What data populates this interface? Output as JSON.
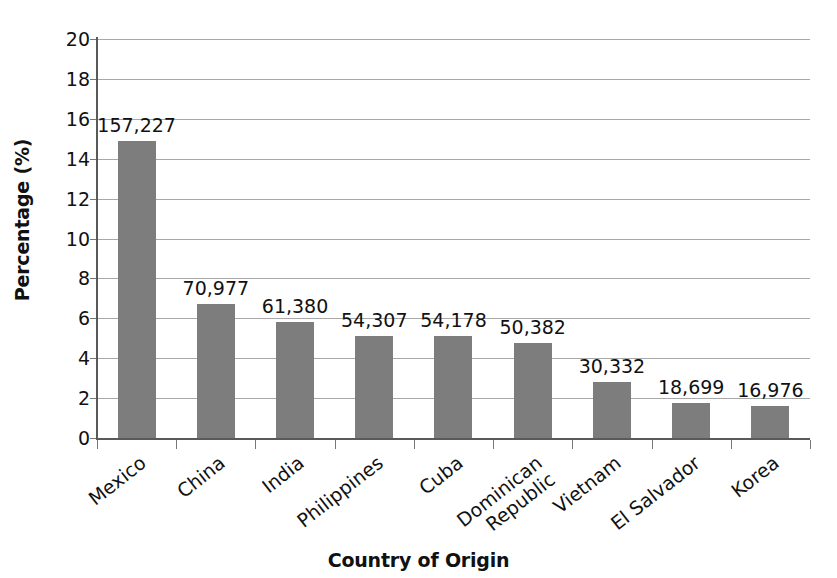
{
  "chart_data": {
    "type": "bar",
    "title": "",
    "xlabel": "Country of Origin",
    "ylabel": "Percentage (%)",
    "ylim": [
      0,
      20
    ],
    "ytick_step": 2,
    "yticks": [
      "20",
      "18",
      "16",
      "14",
      "12",
      "10",
      "8",
      "6",
      "4",
      "2",
      "0"
    ],
    "grid": true,
    "legend": "none",
    "bar_color": "#7d7d7d",
    "gridline_color": "#a8a8a8",
    "axis_color": "#595959",
    "categories": [
      "Mexico",
      "China",
      "India",
      "Philippines",
      "Cuba",
      "Dominican Republic",
      "Vietnam",
      "El Salvador",
      "Korea"
    ],
    "values": [
      14.9,
      6.7,
      5.8,
      5.1,
      5.1,
      4.75,
      2.8,
      1.75,
      1.6
    ],
    "data_labels": [
      "157,227",
      "70,977",
      "61,380",
      "54,307",
      "54,178",
      "50,382",
      "30,332",
      "18,699",
      "16,976"
    ],
    "counts": [
      157227,
      70977,
      61380,
      54307,
      54178,
      50382,
      30332,
      18699,
      16976
    ]
  }
}
